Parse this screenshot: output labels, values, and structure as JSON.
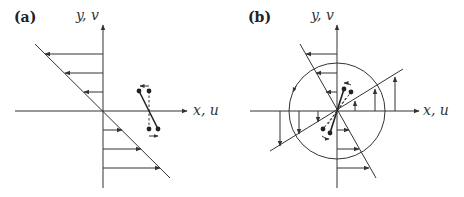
{
  "figure": {
    "panels": [
      {
        "id": "a",
        "label": "(a)",
        "y_axis_label": "y, v",
        "x_axis_label": "x, u",
        "description": "Simple shear flow: velocity profile u proportional to -y, with a rotating dumbbell"
      },
      {
        "id": "b",
        "label": "(b)",
        "y_axis_label": "y, v",
        "x_axis_label": "x, u",
        "description": "Pure rotation decomposition: circle with velocity vectors and rotating dumbbells"
      }
    ],
    "colors": {
      "stroke": "#333333",
      "background": "#ffffff"
    }
  }
}
